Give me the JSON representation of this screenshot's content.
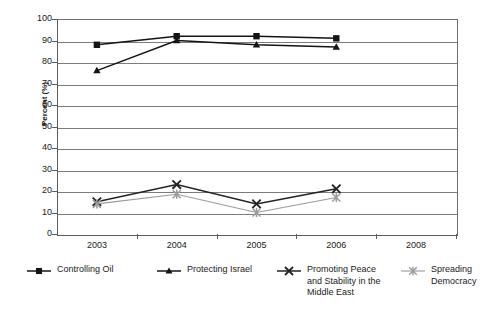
{
  "chart_data": {
    "type": "line",
    "title": "",
    "xlabel": "",
    "ylabel": "Percent (%)",
    "categories": [
      "2003",
      "2004",
      "2005",
      "2006",
      "2008"
    ],
    "xtick_labels": [
      "2003",
      "2004",
      "2005",
      "2006",
      "2008"
    ],
    "ytick_labels": [
      "0",
      "10",
      "20",
      "30",
      "40",
      "50",
      "60",
      "70",
      "80",
      "90",
      "100"
    ],
    "ylim": [
      0,
      100
    ],
    "ytick_step": 10,
    "grid": "horizontal",
    "legend_position": "bottom",
    "series": [
      {
        "name": "Controlling Oil",
        "marker": "filled-square",
        "color": "#141414",
        "values": [
          88,
          92,
          92,
          91,
          null
        ]
      },
      {
        "name": "Protecting Israel",
        "marker": "filled-triangle",
        "color": "#141414",
        "values": [
          76,
          90,
          88,
          87,
          null
        ]
      },
      {
        "name": "Promoting Peace and Stability in the Middle East",
        "marker": "cross-x",
        "color": "#232323",
        "values": [
          15,
          23,
          14,
          21,
          null
        ]
      },
      {
        "name": "Spreading Democracy",
        "marker": "asterisk",
        "color": "#9a9a9a",
        "values": [
          14,
          18.5,
          10,
          17,
          null
        ]
      }
    ]
  },
  "legend": {
    "items": [
      {
        "label": "Controlling Oil"
      },
      {
        "label": "Protecting Israel"
      },
      {
        "label": "Promoting Peace\nand Stability in the\nMiddle East"
      },
      {
        "label": "Spreading\nDemocracy"
      }
    ]
  }
}
